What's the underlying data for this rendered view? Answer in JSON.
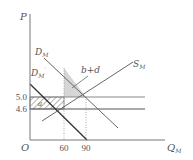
{
  "diagram": {
    "title": "",
    "axes": {
      "y_label": "P",
      "x_label": "Q",
      "x_label_sub": "M",
      "origin_label": "O"
    },
    "price_ticks": [
      {
        "label": "5.0",
        "value": 5.0
      },
      {
        "label": "4.6",
        "value": 4.6
      }
    ],
    "quantity_ticks": [
      {
        "label": "60",
        "value": 60
      },
      {
        "label": "90",
        "value": 90
      }
    ],
    "curves": {
      "demand": {
        "label": "D",
        "sub": "M"
      },
      "demand_prime": {
        "label": "D",
        "sub": "M",
        "prime": "′"
      },
      "supply": {
        "label": "S",
        "sub": "M"
      }
    },
    "annotations": {
      "shaded_area_label": "b+d",
      "hatched_area_label": "a"
    },
    "colors": {
      "axis": "#777777",
      "line": "#666666",
      "dark_line": "#333333",
      "shade": "#d6d6d6",
      "hatch": "#555555",
      "text": "#555555"
    }
  }
}
